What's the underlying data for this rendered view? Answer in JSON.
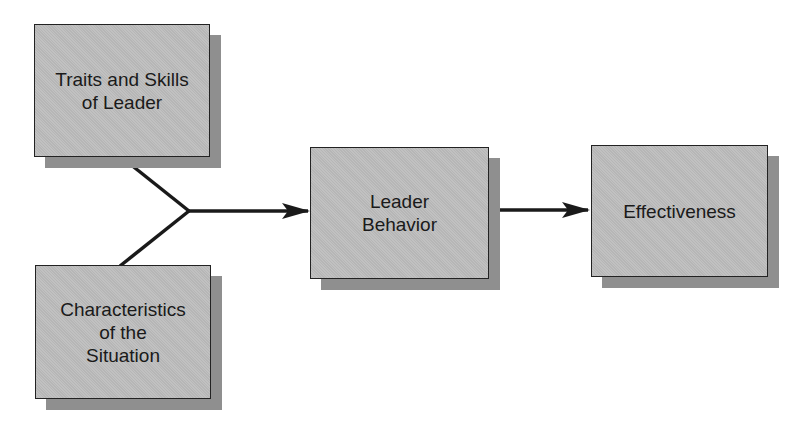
{
  "diagram": {
    "nodes": [
      {
        "id": "traits",
        "label": "Traits and Skills\nof Leader"
      },
      {
        "id": "situation",
        "label": "Characteristics\nof the\nSituation"
      },
      {
        "id": "behavior",
        "label": "Leader\nBehavior"
      },
      {
        "id": "effectiveness",
        "label": "Effectiveness"
      }
    ],
    "edges": [
      {
        "from": "traits",
        "to": "behavior"
      },
      {
        "from": "situation",
        "to": "behavior"
      },
      {
        "from": "behavior",
        "to": "effectiveness"
      }
    ],
    "colors": {
      "box_fill": "#bdbdbd",
      "box_shadow": "#8f8f8f",
      "stroke": "#1a1a1a",
      "background": "#ffffff"
    }
  }
}
